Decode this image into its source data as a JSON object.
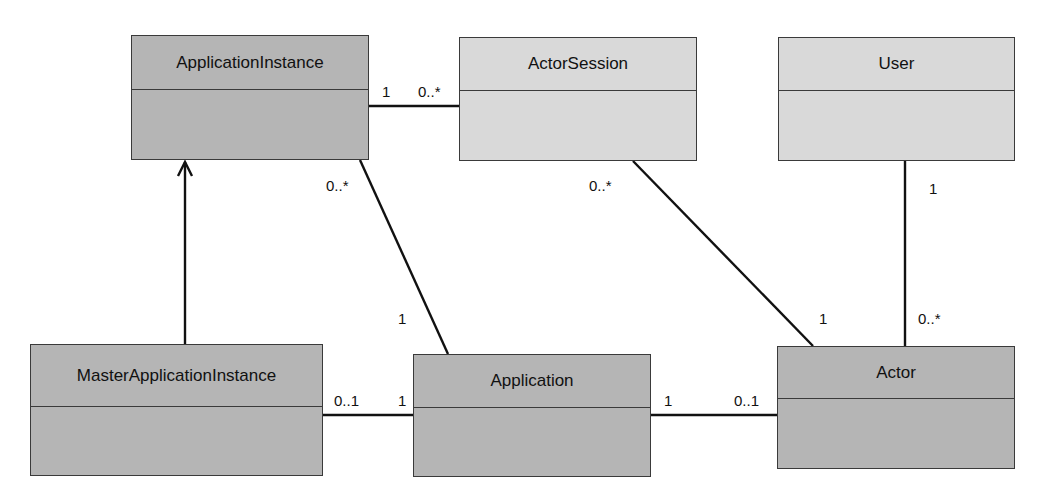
{
  "diagram": {
    "type": "UML class diagram",
    "classes": [
      {
        "id": "application_instance",
        "name": "ApplicationInstance",
        "style": "dark",
        "x": 131,
        "y": 35,
        "w": 238,
        "h": 125,
        "header_h": 54
      },
      {
        "id": "actor_session",
        "name": "ActorSession",
        "style": "light",
        "x": 459,
        "y": 37,
        "w": 238,
        "h": 124,
        "header_h": 53
      },
      {
        "id": "user",
        "name": "User",
        "style": "light",
        "x": 778,
        "y": 37,
        "w": 237,
        "h": 124,
        "header_h": 53
      },
      {
        "id": "master_application_instance",
        "name": "MasterApplicationInstance",
        "style": "dark",
        "x": 30,
        "y": 344,
        "w": 293,
        "h": 132,
        "header_h": 62
      },
      {
        "id": "application",
        "name": "Application",
        "style": "dark",
        "x": 413,
        "y": 354,
        "w": 238,
        "h": 123,
        "header_h": 53
      },
      {
        "id": "actor",
        "name": "Actor",
        "style": "dark",
        "x": 777,
        "y": 346,
        "w": 238,
        "h": 123,
        "header_h": 53
      }
    ],
    "relationships": [
      {
        "id": "ai_as",
        "kind": "association",
        "from": "ApplicationInstance",
        "to": "ActorSession",
        "from_mult": "1",
        "to_mult": "0..*"
      },
      {
        "id": "ai_app",
        "kind": "association",
        "from": "ApplicationInstance",
        "to": "Application",
        "from_mult": "0..*",
        "to_mult": "1"
      },
      {
        "id": "as_actor",
        "kind": "association",
        "from": "ActorSession",
        "to": "Actor",
        "from_mult": "0..*",
        "to_mult": "1"
      },
      {
        "id": "user_actor",
        "kind": "association",
        "from": "User",
        "to": "Actor",
        "from_mult": "1",
        "to_mult": "0..*"
      },
      {
        "id": "mai_app",
        "kind": "association",
        "from": "MasterApplicationInstance",
        "to": "Application",
        "from_mult": "0..1",
        "to_mult": "1"
      },
      {
        "id": "app_actor",
        "kind": "association",
        "from": "Application",
        "to": "Actor",
        "from_mult": "1",
        "to_mult": "0..1"
      },
      {
        "id": "mai_ai",
        "kind": "generalization-arrow",
        "from": "MasterApplicationInstance",
        "to": "ApplicationInstance"
      }
    ],
    "multiplicity_labels": {
      "ai_as_from": "1",
      "ai_as_to": "0..*",
      "ai_app_from": "0..*",
      "ai_app_to": "1",
      "as_actor_from": "0..*",
      "as_actor_to": "1",
      "user_actor_from": "1",
      "user_actor_to": "0..*",
      "mai_app_from": "0..1",
      "mai_app_to": "1",
      "app_actor_from": "1",
      "app_actor_to": "0..1"
    },
    "colors": {
      "dark_fill": "#b5b5b5",
      "light_fill": "#d9d9d9",
      "line": "#111111"
    }
  }
}
